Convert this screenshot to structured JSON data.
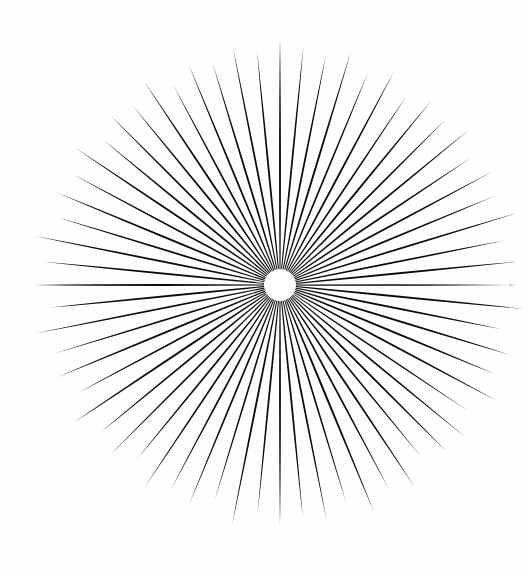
{
  "artwork": {
    "title": "Starburst",
    "subject": "radial sunburst / starburst figure",
    "medium": "black ink on white paper",
    "background_color": "#fefefe",
    "ink_color": "#0a0a0a",
    "canvas": {
      "width": 528,
      "height": 575
    }
  },
  "chart_data": {
    "type": "radial-burst",
    "title": "Starburst",
    "center": {
      "x": 280,
      "y": 285
    },
    "hub": {
      "shape": "circle",
      "radius": 16,
      "fill": "#ffffff",
      "label": "white center hub"
    },
    "ray_count": 64,
    "angle_step_deg": 5.625,
    "start_angle_deg": 0,
    "inner_radius": 13,
    "outer_radius_mean": 240,
    "outer_radius_min": 214,
    "outer_radius_max": 250,
    "base_half_width_deg": 1.95,
    "taper": "linear to sharp point",
    "color": "#0a0a0a",
    "rays": [
      {
        "i": 0,
        "angle": 0.0,
        "length": 247,
        "half_width": 2.0
      },
      {
        "i": 1,
        "angle": 5.6,
        "length": 240,
        "half_width": 1.9
      },
      {
        "i": 2,
        "angle": 11.3,
        "length": 236,
        "half_width": 1.95
      },
      {
        "i": 3,
        "angle": 16.9,
        "length": 244,
        "half_width": 2.05
      },
      {
        "i": 4,
        "angle": 22.5,
        "length": 231,
        "half_width": 1.85
      },
      {
        "i": 5,
        "angle": 28.1,
        "length": 243,
        "half_width": 2.0
      },
      {
        "i": 6,
        "angle": 33.8,
        "length": 228,
        "half_width": 1.9
      },
      {
        "i": 7,
        "angle": 39.4,
        "length": 239,
        "half_width": 2.05
      },
      {
        "i": 8,
        "angle": 45.0,
        "length": 234,
        "half_width": 1.95
      },
      {
        "i": 9,
        "angle": 50.6,
        "length": 245,
        "half_width": 1.88
      },
      {
        "i": 10,
        "angle": 56.3,
        "length": 229,
        "half_width": 2.02
      },
      {
        "i": 11,
        "angle": 61.9,
        "length": 241,
        "half_width": 1.92
      },
      {
        "i": 12,
        "angle": 67.5,
        "length": 233,
        "half_width": 2.0
      },
      {
        "i": 13,
        "angle": 73.1,
        "length": 246,
        "half_width": 1.86
      },
      {
        "i": 14,
        "angle": 78.8,
        "length": 230,
        "half_width": 1.98
      },
      {
        "i": 15,
        "angle": 84.4,
        "length": 238,
        "half_width": 2.06
      },
      {
        "i": 16,
        "angle": 90.0,
        "length": 237,
        "half_width": 1.9
      },
      {
        "i": 17,
        "angle": 95.6,
        "length": 244,
        "half_width": 1.96
      },
      {
        "i": 18,
        "angle": 101.3,
        "length": 226,
        "half_width": 2.03
      },
      {
        "i": 19,
        "angle": 106.9,
        "length": 240,
        "half_width": 1.89
      },
      {
        "i": 20,
        "angle": 112.5,
        "length": 232,
        "half_width": 1.99
      },
      {
        "i": 21,
        "angle": 118.1,
        "length": 247,
        "half_width": 2.04
      },
      {
        "i": 22,
        "angle": 123.8,
        "length": 228,
        "half_width": 1.87
      },
      {
        "i": 23,
        "angle": 129.4,
        "length": 242,
        "half_width": 1.97
      },
      {
        "i": 24,
        "angle": 135.0,
        "length": 235,
        "half_width": 2.01
      },
      {
        "i": 25,
        "angle": 140.6,
        "length": 222,
        "half_width": 1.91
      },
      {
        "i": 26,
        "angle": 146.3,
        "length": 243,
        "half_width": 2.0
      },
      {
        "i": 27,
        "angle": 151.9,
        "length": 231,
        "half_width": 1.93
      },
      {
        "i": 28,
        "angle": 157.5,
        "length": 246,
        "half_width": 2.05
      },
      {
        "i": 29,
        "angle": 163.1,
        "length": 227,
        "half_width": 1.88
      },
      {
        "i": 30,
        "angle": 168.8,
        "length": 239,
        "half_width": 1.98
      },
      {
        "i": 31,
        "angle": 174.4,
        "length": 233,
        "half_width": 2.02
      },
      {
        "i": 32,
        "angle": 180.0,
        "length": 240,
        "half_width": 1.94
      },
      {
        "i": 33,
        "angle": 185.6,
        "length": 229,
        "half_width": 1.99
      },
      {
        "i": 34,
        "angle": 191.3,
        "length": 244,
        "half_width": 2.03
      },
      {
        "i": 35,
        "angle": 196.9,
        "length": 225,
        "half_width": 1.86
      },
      {
        "i": 36,
        "angle": 202.5,
        "length": 238,
        "half_width": 1.96
      },
      {
        "i": 37,
        "angle": 208.1,
        "length": 232,
        "half_width": 2.0
      },
      {
        "i": 38,
        "angle": 213.8,
        "length": 245,
        "half_width": 1.9
      },
      {
        "i": 39,
        "angle": 219.4,
        "length": 226,
        "half_width": 2.04
      },
      {
        "i": 40,
        "angle": 225.0,
        "length": 241,
        "half_width": 1.95
      },
      {
        "i": 41,
        "angle": 230.6,
        "length": 234,
        "half_width": 1.89
      },
      {
        "i": 42,
        "angle": 236.3,
        "length": 248,
        "half_width": 2.01
      },
      {
        "i": 43,
        "angle": 241.9,
        "length": 228,
        "half_width": 1.92
      },
      {
        "i": 44,
        "angle": 247.5,
        "length": 242,
        "half_width": 2.06
      },
      {
        "i": 45,
        "angle": 253.1,
        "length": 236,
        "half_width": 1.97
      },
      {
        "i": 46,
        "angle": 258.8,
        "length": 249,
        "half_width": 1.87
      },
      {
        "i": 47,
        "angle": 264.4,
        "length": 230,
        "half_width": 2.0
      },
      {
        "i": 48,
        "angle": 270.0,
        "length": 246,
        "half_width": 1.93
      },
      {
        "i": 49,
        "angle": 275.6,
        "length": 238,
        "half_width": 2.02
      },
      {
        "i": 50,
        "angle": 281.3,
        "length": 250,
        "half_width": 1.91
      },
      {
        "i": 51,
        "angle": 286.9,
        "length": 231,
        "half_width": 1.98
      },
      {
        "i": 52,
        "angle": 292.5,
        "length": 243,
        "half_width": 2.05
      },
      {
        "i": 53,
        "angle": 298.1,
        "length": 235,
        "half_width": 1.88
      },
      {
        "i": 54,
        "angle": 303.8,
        "length": 247,
        "half_width": 1.96
      },
      {
        "i": 55,
        "angle": 309.4,
        "length": 229,
        "half_width": 2.03
      },
      {
        "i": 56,
        "angle": 315.0,
        "length": 240,
        "half_width": 1.94
      },
      {
        "i": 57,
        "angle": 320.6,
        "length": 233,
        "half_width": 1.99
      },
      {
        "i": 58,
        "angle": 326.3,
        "length": 245,
        "half_width": 2.01
      },
      {
        "i": 59,
        "angle": 331.9,
        "length": 227,
        "half_width": 1.9
      },
      {
        "i": 60,
        "angle": 337.5,
        "length": 239,
        "half_width": 1.97
      },
      {
        "i": 61,
        "angle": 343.1,
        "length": 232,
        "half_width": 2.04
      },
      {
        "i": 62,
        "angle": 348.8,
        "length": 244,
        "half_width": 1.89
      },
      {
        "i": 63,
        "angle": 354.4,
        "length": 236,
        "half_width": 2.0
      }
    ]
  }
}
